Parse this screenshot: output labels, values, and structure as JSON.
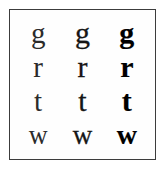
{
  "specimen": {
    "title": "Letterform weight specimen",
    "background_color": "#ffffff",
    "frame_color": "#3c3c3c",
    "text_color": "#111111",
    "columns": [
      {
        "name": "light",
        "label": "Light"
      },
      {
        "name": "regular",
        "label": "Regular"
      },
      {
        "name": "bold",
        "label": "Bold"
      }
    ],
    "rows": [
      {
        "name": "row-g",
        "letter": "g",
        "cells": [
          {
            "glyph": "g",
            "weight": "light"
          },
          {
            "glyph": "g",
            "weight": "regular"
          },
          {
            "glyph": "g",
            "weight": "bold"
          }
        ]
      },
      {
        "name": "row-r",
        "letter": "r",
        "cells": [
          {
            "glyph": "r",
            "weight": "light"
          },
          {
            "glyph": "r",
            "weight": "regular"
          },
          {
            "glyph": "r",
            "weight": "bold"
          }
        ]
      },
      {
        "name": "row-t",
        "letter": "t",
        "cells": [
          {
            "glyph": "t",
            "weight": "light"
          },
          {
            "glyph": "t",
            "weight": "regular"
          },
          {
            "glyph": "t",
            "weight": "bold"
          }
        ]
      },
      {
        "name": "row-w",
        "letter": "w",
        "cells": [
          {
            "glyph": "w",
            "weight": "light"
          },
          {
            "glyph": "w",
            "weight": "regular"
          },
          {
            "glyph": "w",
            "weight": "bold"
          }
        ]
      }
    ]
  }
}
